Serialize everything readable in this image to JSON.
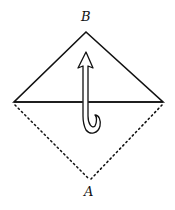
{
  "diagram": {
    "type": "fold-diagram",
    "labels": {
      "top_point": "B",
      "bottom_point": "A"
    },
    "shapes": {
      "upper_triangle": "solid",
      "lower_triangle": "dotted"
    },
    "arrow": {
      "direction": "up",
      "style": "hooked-fold-arrow"
    },
    "colors": {
      "line": "#111111",
      "background": "#ffffff"
    }
  }
}
